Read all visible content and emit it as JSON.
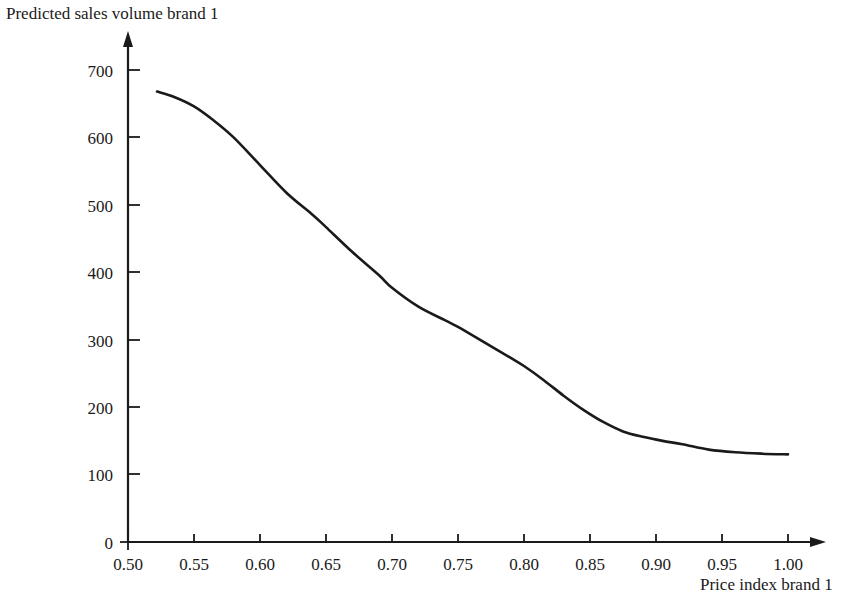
{
  "chart_data": {
    "type": "line",
    "title": "Predicted sales volume brand 1",
    "xlabel": "Price index brand 1",
    "ylabel": "",
    "xlim": [
      0.5,
      1.0
    ],
    "ylim": [
      0,
      700
    ],
    "grid": false,
    "legend": null,
    "x_ticks": [
      "0.50",
      "0.55",
      "0.60",
      "0.65",
      "0.70",
      "0.75",
      "0.80",
      "0.85",
      "0.90",
      "0.95",
      "1.00"
    ],
    "x_tick_values": [
      0.5,
      0.55,
      0.6,
      0.65,
      0.7,
      0.75,
      0.8,
      0.85,
      0.9,
      0.95,
      1.0
    ],
    "y_ticks": [
      "0",
      "100",
      "200",
      "300",
      "400",
      "500",
      "600",
      "700"
    ],
    "y_tick_values": [
      0,
      100,
      200,
      300,
      400,
      500,
      600,
      700
    ],
    "series": [
      {
        "name": "Predicted sales volume brand 1",
        "color": "#1a1a1a",
        "line_width": 2.6,
        "x": [
          0.522,
          0.535,
          0.55,
          0.565,
          0.58,
          0.6,
          0.62,
          0.64,
          0.65,
          0.67,
          0.69,
          0.7,
          0.72,
          0.74,
          0.75,
          0.77,
          0.79,
          0.8,
          0.815,
          0.83,
          0.845,
          0.86,
          0.875,
          0.89,
          0.905,
          0.92,
          0.94,
          0.96,
          0.98,
          1.0
        ],
        "values": [
          668,
          660,
          646,
          625,
          600,
          559,
          518,
          485,
          467,
          430,
          396,
          377,
          349,
          329,
          319,
          296,
          273,
          261,
          240,
          217,
          196,
          178,
          164,
          156,
          150,
          145,
          137,
          133,
          131,
          130
        ]
      }
    ],
    "annotations": [
      {
        "text": "axis arrows point up and right",
        "visible": false
      }
    ]
  },
  "axes": {
    "y_axis_arrow": "arrow-up",
    "x_axis_arrow": "arrow-right",
    "axis_color": "#1a1a1a"
  }
}
